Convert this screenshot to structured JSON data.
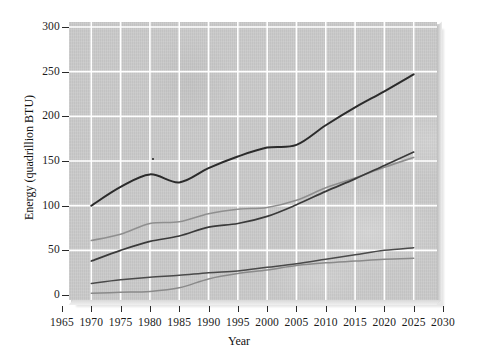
{
  "chart_data": {
    "type": "line",
    "title": "",
    "xlabel": "Year",
    "ylabel": "Energy (quadrillion BTU)",
    "xlim": [
      1965,
      2030
    ],
    "ylim": [
      0,
      300
    ],
    "xticks": [
      1965,
      1970,
      1975,
      1980,
      1985,
      1990,
      1995,
      2000,
      2005,
      2010,
      2015,
      2020,
      2025,
      2030
    ],
    "yticks": [
      0,
      50,
      100,
      150,
      200,
      250,
      300
    ],
    "grid": true,
    "legend": "none",
    "x": [
      1970,
      1975,
      1980,
      1985,
      1990,
      1995,
      2000,
      2005,
      2010,
      2015,
      2020,
      2025
    ],
    "series": [
      {
        "name": "total",
        "color": "#2b2b2b",
        "width": 2.0,
        "values": [
          100,
          121,
          135,
          126,
          142,
          155,
          165,
          168,
          190,
          210,
          228,
          247
        ]
      },
      {
        "name": "upper-gray",
        "color": "#8f8f8f",
        "width": 1.6,
        "values": [
          61,
          68,
          80,
          82,
          91,
          96,
          98,
          106,
          120,
          131,
          143,
          154
        ]
      },
      {
        "name": "mid-dark",
        "color": "#3a3a3a",
        "width": 1.7,
        "values": [
          38,
          50,
          60,
          66,
          76,
          80,
          88,
          101,
          116,
          130,
          145,
          160
        ]
      },
      {
        "name": "lower-dark",
        "color": "#4a4a4a",
        "width": 1.5,
        "values": [
          13,
          17,
          20,
          22,
          25,
          27,
          31,
          35,
          40,
          45,
          50,
          53
        ]
      },
      {
        "name": "lower-gray",
        "color": "#8a8a8a",
        "width": 1.5,
        "values": [
          2,
          3,
          4,
          8,
          18,
          24,
          28,
          33,
          36,
          38,
          40,
          41
        ]
      }
    ]
  },
  "axes": {
    "y_tick_labels": [
      "300",
      "250",
      "200",
      "150",
      "100",
      "50",
      "0"
    ],
    "x_tick_labels": [
      "1965",
      "1970",
      "1975",
      "1980",
      "1985",
      "1990",
      "1995",
      "2000",
      "2005",
      "2010",
      "2015",
      "2020",
      "2025",
      "2030"
    ],
    "y_title": "Energy (quadrillion BTU)",
    "x_title": "Year"
  },
  "style": {
    "panel_background": "#c8c8c8",
    "gridline_color": "#ffffff",
    "page_background": "#ffffff",
    "text_color": "#1b1b1b"
  }
}
